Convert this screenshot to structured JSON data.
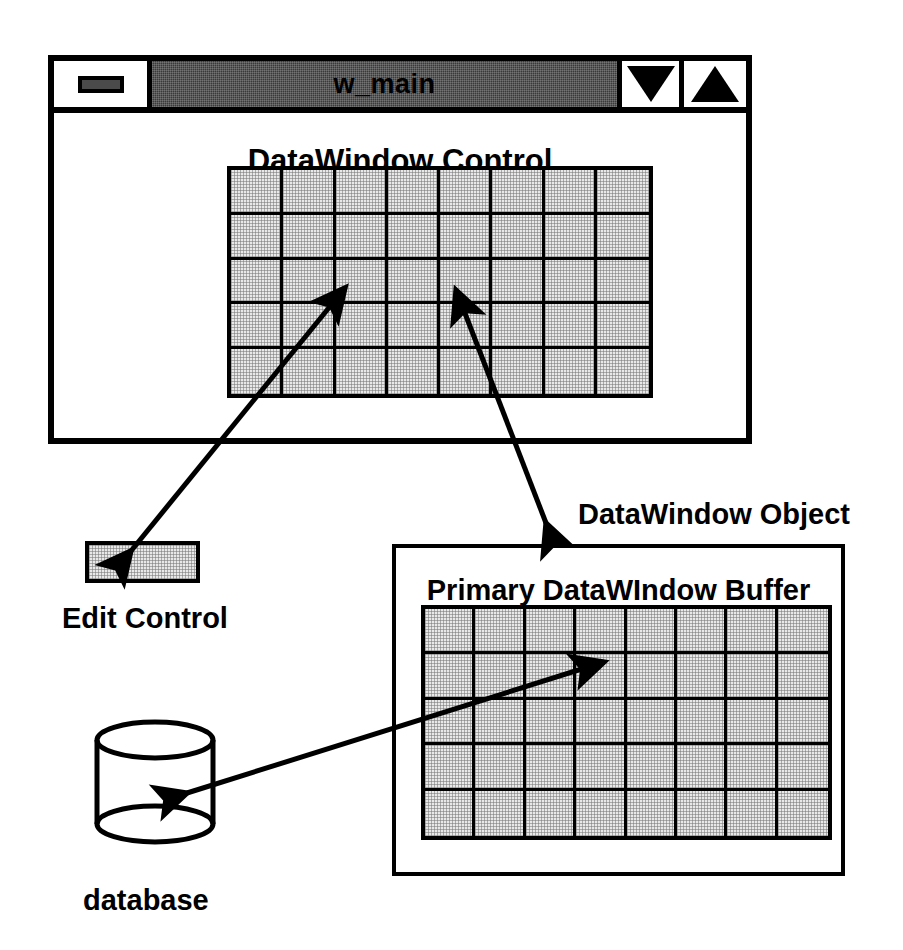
{
  "diagram": {
    "background_color": "#ffffff",
    "line_color": "#000000",
    "fill_color": "#e8e8e8",
    "titlebar_color": "#3a3a3a"
  },
  "window": {
    "title": "w_main",
    "sysmenu_icon": "system-menu-icon",
    "minimize_icon": "triangle-down-icon",
    "maximize_icon": "triangle-up-icon"
  },
  "datawindow_control": {
    "label": "DataWindow Control",
    "grid": {
      "columns": 8,
      "rows": 5
    }
  },
  "edit_control": {
    "label": "Edit Control"
  },
  "datawindow_object": {
    "label": "DataWindow Object",
    "buffer_label": "Primary DataWIndow Buffer",
    "grid": {
      "columns": 8,
      "rows": 5
    }
  },
  "database": {
    "label": "database",
    "icon": "cylinder-icon"
  },
  "connections": [
    {
      "name": "edit-control-to-datawindow-control",
      "from": "Edit Control",
      "to": "DataWindow Control",
      "style": "double-headed-arrow"
    },
    {
      "name": "datawindow-control-to-datawindow-object",
      "from": "DataWindow Control",
      "to": "DataWindow Object",
      "style": "double-headed-arrow"
    },
    {
      "name": "database-to-primary-buffer",
      "from": "database",
      "to": "Primary DataWIndow Buffer",
      "style": "double-headed-arrow"
    }
  ]
}
